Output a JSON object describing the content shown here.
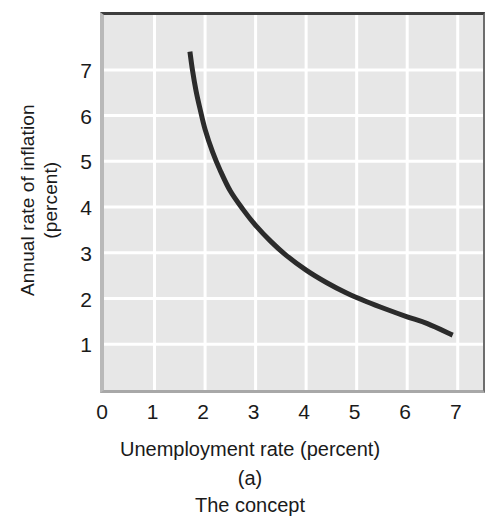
{
  "figure": {
    "panel_label": "(a)",
    "panel_caption": "The concept"
  },
  "chart_data": {
    "type": "line",
    "title": "",
    "subtitle": "",
    "xlabel": "Unemployment rate (percent)",
    "ylabel": "Annual rate of inflation (percent)",
    "ylabel_line1": "Annual rate of inflation",
    "ylabel_line2": "(percent)",
    "xlim": [
      0,
      7.5
    ],
    "ylim": [
      0,
      8.2
    ],
    "xticks": [
      0,
      1,
      2,
      3,
      4,
      5,
      6,
      7
    ],
    "xtick_labels": [
      "0",
      "1",
      "2",
      "3",
      "4",
      "5",
      "6",
      "7"
    ],
    "yticks": [
      1,
      2,
      3,
      4,
      5,
      6,
      7
    ],
    "ytick_labels": [
      "1",
      "2",
      "3",
      "4",
      "5",
      "6",
      "7"
    ],
    "grid": true,
    "grid_color": "#ffffff",
    "plot_background": "#e7e7e7",
    "legend": null,
    "legend_position": "none",
    "series": [
      {
        "name": "Phillips curve",
        "color": "#2b2b2b",
        "line_width": 5,
        "x": [
          1.7,
          1.75,
          1.82,
          1.9,
          2.0,
          2.15,
          2.3,
          2.5,
          2.75,
          3.0,
          3.3,
          3.6,
          4.0,
          4.4,
          4.8,
          5.2,
          5.6,
          6.0,
          6.4,
          6.9
        ],
        "y": [
          7.4,
          7.0,
          6.55,
          6.15,
          5.7,
          5.2,
          4.8,
          4.35,
          3.95,
          3.6,
          3.25,
          2.95,
          2.62,
          2.35,
          2.12,
          1.93,
          1.76,
          1.6,
          1.45,
          1.2
        ]
      }
    ],
    "annotations": []
  },
  "colors": {
    "curve": "#2b2b2b",
    "plot_bg": "#e7e7e7",
    "grid": "#ffffff",
    "text": "#1a1a1a"
  }
}
